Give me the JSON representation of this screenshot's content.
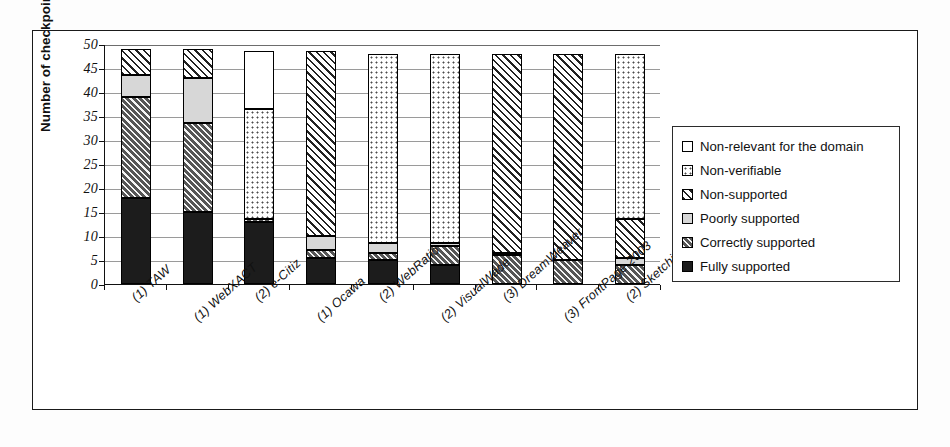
{
  "chart_data": {
    "type": "bar",
    "subtype": "stacked-vertical",
    "title": "",
    "xlabel": "",
    "ylabel": "Number of checkpoints",
    "ylim": [
      0,
      50
    ],
    "ytick_step": 5,
    "yticks": [
      50,
      45,
      40,
      35,
      30,
      25,
      20,
      15,
      10,
      5,
      0
    ],
    "grid": true,
    "legend_position": "right",
    "categories": [
      "(1) TAW",
      "(1) WebXACT",
      "(2) e-Citiz",
      "(1) Ocawa",
      "(2) WebRatio",
      "(2) VisualWade",
      "(3) DreamWeaver",
      "(3) FrontPage 2003",
      "(2) SketchiXML"
    ],
    "series": [
      {
        "name": "Fully supported",
        "pattern": "solid-black",
        "values": [
          18,
          15,
          13,
          5.5,
          5,
          4,
          0,
          0,
          0
        ]
      },
      {
        "name": "Correctly supported",
        "pattern": "dark-hatch",
        "values": [
          21,
          18.5,
          0.5,
          1.5,
          1.5,
          4,
          6,
          5,
          4
        ]
      },
      {
        "name": "Poorly supported",
        "pattern": "light-gray",
        "values": [
          4.5,
          9.5,
          0,
          3,
          2,
          0.5,
          0.5,
          0,
          1.5
        ]
      },
      {
        "name": "Non-supported",
        "pattern": "diagonal-hatch",
        "values": [
          5.5,
          6,
          0,
          38.5,
          0,
          0,
          41.5,
          43,
          8
        ]
      },
      {
        "name": "Non-verifiable",
        "pattern": "dotted",
        "values": [
          0,
          0,
          23,
          0,
          39.5,
          39.5,
          0,
          0,
          34.5
        ]
      },
      {
        "name": "Non-relevant for the domain",
        "pattern": "white",
        "values": [
          0,
          0,
          12,
          0,
          0,
          0,
          0,
          0,
          0
        ]
      }
    ],
    "totals": [
      49,
      49,
      48.5,
      48.5,
      48,
      48,
      48,
      48,
      48
    ]
  },
  "legend": {
    "items": [
      {
        "label": "Non-relevant for the domain",
        "pattern": "white"
      },
      {
        "label": "Non-verifiable",
        "pattern": "dotted"
      },
      {
        "label": "Non-supported",
        "pattern": "diagonal-hatch"
      },
      {
        "label": "Poorly supported",
        "pattern": "light-gray"
      },
      {
        "label": "Correctly supported",
        "pattern": "dark-hatch"
      },
      {
        "label": "Fully supported",
        "pattern": "solid-black"
      }
    ]
  },
  "colors": {
    "fully_supported": "#1c1c1c",
    "correctly_supported": "#555555",
    "poorly_supported": "#d7d7d7",
    "non_supported": "#ffffff",
    "non_verifiable": "#ffffff",
    "non_relevant": "#ffffff",
    "axis": "#111111",
    "gridline": "#9a9a9a",
    "frame": "#1a1a1a"
  }
}
